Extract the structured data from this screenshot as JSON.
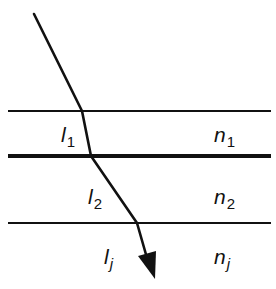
{
  "diagram": {
    "colors": {
      "line": "#111111",
      "background": "#ffffff"
    },
    "interfaces": [
      {
        "name": "interface-1",
        "y": 111,
        "x1": 8,
        "x2": 271,
        "stroke_width": 2
      },
      {
        "name": "interface-2",
        "y": 156,
        "x1": 8,
        "x2": 271,
        "stroke_width": 4
      },
      {
        "name": "interface-3",
        "y": 223,
        "x1": 8,
        "x2": 271,
        "stroke_width": 2
      }
    ],
    "ray": {
      "points": [
        [
          34,
          14
        ],
        [
          82,
          111
        ],
        [
          91,
          156
        ],
        [
          137,
          223
        ],
        [
          147,
          258
        ]
      ],
      "arrow_tip": [
        155,
        279
      ],
      "arrow_base": [
        [
          138,
          256
        ],
        [
          156,
          251
        ]
      ]
    },
    "layers": [
      {
        "path_label": {
          "main": "l",
          "sub": "1",
          "sub_italic": false
        },
        "index_label": {
          "main": "n",
          "sub": "1",
          "sub_italic": false
        }
      },
      {
        "path_label": {
          "main": "l",
          "sub": "2",
          "sub_italic": false
        },
        "index_label": {
          "main": "n",
          "sub": "2",
          "sub_italic": false
        }
      },
      {
        "path_label": {
          "main": "l",
          "sub": "j",
          "sub_italic": true
        },
        "index_label": {
          "main": "n",
          "sub": "j",
          "sub_italic": true
        }
      }
    ]
  }
}
